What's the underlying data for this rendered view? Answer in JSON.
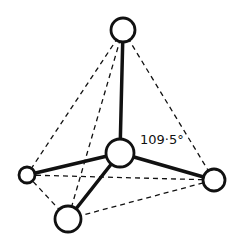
{
  "diagram": {
    "angle_label": "109·5°",
    "colors": {
      "stroke": "#111111",
      "background": "#ffffff",
      "atom_fill": "#ffffff"
    },
    "atoms": [
      {
        "id": "center",
        "x": 120,
        "y": 153,
        "r": 14
      },
      {
        "id": "top",
        "x": 123,
        "y": 30,
        "r": 12
      },
      {
        "id": "left",
        "x": 27,
        "y": 175,
        "r": 8
      },
      {
        "id": "right",
        "x": 214,
        "y": 180,
        "r": 11
      },
      {
        "id": "bottom",
        "x": 68,
        "y": 219,
        "r": 13
      }
    ],
    "bonds": [
      [
        "center",
        "top"
      ],
      [
        "center",
        "left"
      ],
      [
        "center",
        "right"
      ],
      [
        "center",
        "bottom"
      ]
    ],
    "edges_dashed": [
      [
        "top",
        "left"
      ],
      [
        "top",
        "right"
      ],
      [
        "top",
        "bottom"
      ],
      [
        "left",
        "right"
      ],
      [
        "left",
        "bottom"
      ],
      [
        "bottom",
        "right"
      ]
    ]
  }
}
